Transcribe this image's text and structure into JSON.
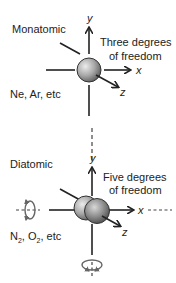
{
  "monatomic": {
    "title": "Monatomic",
    "freedom_line1": "Three degrees",
    "freedom_line2": "of freedom",
    "examples": "Ne, Ar, etc",
    "axes": {
      "x": "x",
      "y": "y",
      "z": "z"
    }
  },
  "diatomic": {
    "title": "Diatomic",
    "freedom_line1": "Five degrees",
    "freedom_line2": "of freedom",
    "examples_n": "N",
    "examples_sub1": "2",
    "examples_o": ", O",
    "examples_sub2": "2",
    "examples_rest": ", etc",
    "axes": {
      "x": "x",
      "y": "y",
      "z": "z"
    }
  },
  "colors": {
    "line": "#222222",
    "sphere_light": "#e6e6e6",
    "sphere_dark": "#6e6e6e",
    "rotation_arrow": "#666666"
  }
}
